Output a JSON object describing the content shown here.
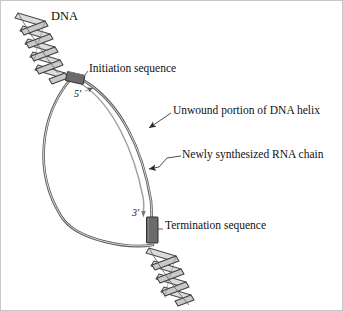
{
  "figure": {
    "background_color": "#ffffff",
    "frame_color": "#c8c8c8"
  },
  "labels": {
    "dna": "DNA",
    "initiation_sequence": "Initiation sequence",
    "unwound_portion": "Unwound portion of DNA helix",
    "rna_chain": "Newly synthesized RNA chain",
    "termination_sequence": "Termination sequence",
    "five_prime": "5'",
    "three_prime": "3'"
  },
  "colors": {
    "dna_strand": "#4a4a4a",
    "dna_strand_fill": "#d8d8d8",
    "rna_strand": "#9a9a9a",
    "sequence_box": "#6b6b6b",
    "sequence_box_edge": "#333333",
    "leader_line": "#3a3a3a",
    "text": "#111111"
  },
  "elements": {
    "helix_top": "dna-double-helix-upper",
    "helix_bottom": "dna-double-helix-lower",
    "bubble": "transcription-bubble",
    "initiation_box": "initiation-sequence-box",
    "termination_box": "termination-sequence-box",
    "rna_strand": "newly-synthesized-rna-strand"
  }
}
